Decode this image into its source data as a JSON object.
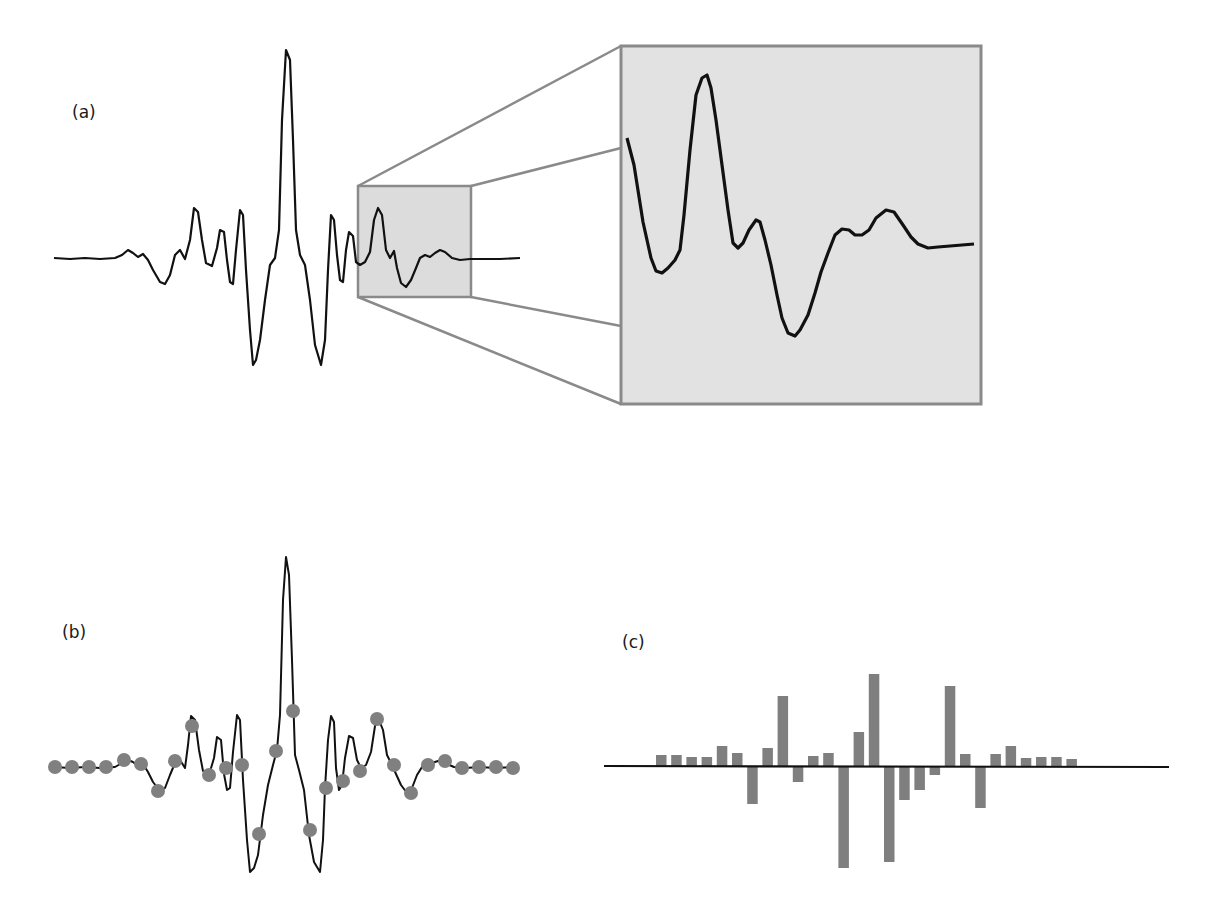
{
  "panels": {
    "a": {
      "label": "(a)",
      "description": "Wavelet-like signal with zoomed region inset"
    },
    "b": {
      "label": "(b)",
      "description": "Signal with sampled points"
    },
    "c": {
      "label": "(c)",
      "description": "Sampled values as bars"
    }
  },
  "colors": {
    "signal": "#111111",
    "zoom_box_fill": "#dcdcdc",
    "zoom_box_border": "#8a8a8a",
    "connector": "#8a8a8a",
    "sample_dot": "#808080",
    "bar": "#7f7f7f",
    "baseline": "#111111"
  },
  "chart_data": {
    "type": "bar",
    "title": "(c)",
    "xlabel": "",
    "ylabel": "",
    "categories": [
      "1",
      "2",
      "3",
      "4",
      "5",
      "6",
      "7",
      "8",
      "9",
      "10",
      "11",
      "12",
      "13",
      "14",
      "15",
      "16",
      "17",
      "18",
      "19",
      "20",
      "21",
      "22",
      "23",
      "24",
      "25",
      "26",
      "27",
      "28"
    ],
    "values": [
      11,
      11,
      9,
      9,
      20,
      13,
      -38,
      18,
      70,
      -16,
      10,
      13,
      -102,
      34,
      92,
      -96,
      -34,
      -24,
      -9,
      80,
      12,
      -42,
      12,
      20,
      8,
      9,
      9,
      7
    ],
    "grid": false,
    "legend": "none"
  }
}
